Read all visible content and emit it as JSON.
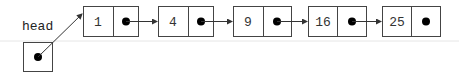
{
  "diagram": {
    "type": "singly-linked-list",
    "head_label": "head",
    "nodes": [
      {
        "value": "1"
      },
      {
        "value": "4"
      },
      {
        "value": "9"
      },
      {
        "value": "16"
      },
      {
        "value": "25"
      }
    ],
    "colors": {
      "stroke": "#444444",
      "dot": "#000000",
      "divider_line": "#e6e6e6"
    }
  }
}
